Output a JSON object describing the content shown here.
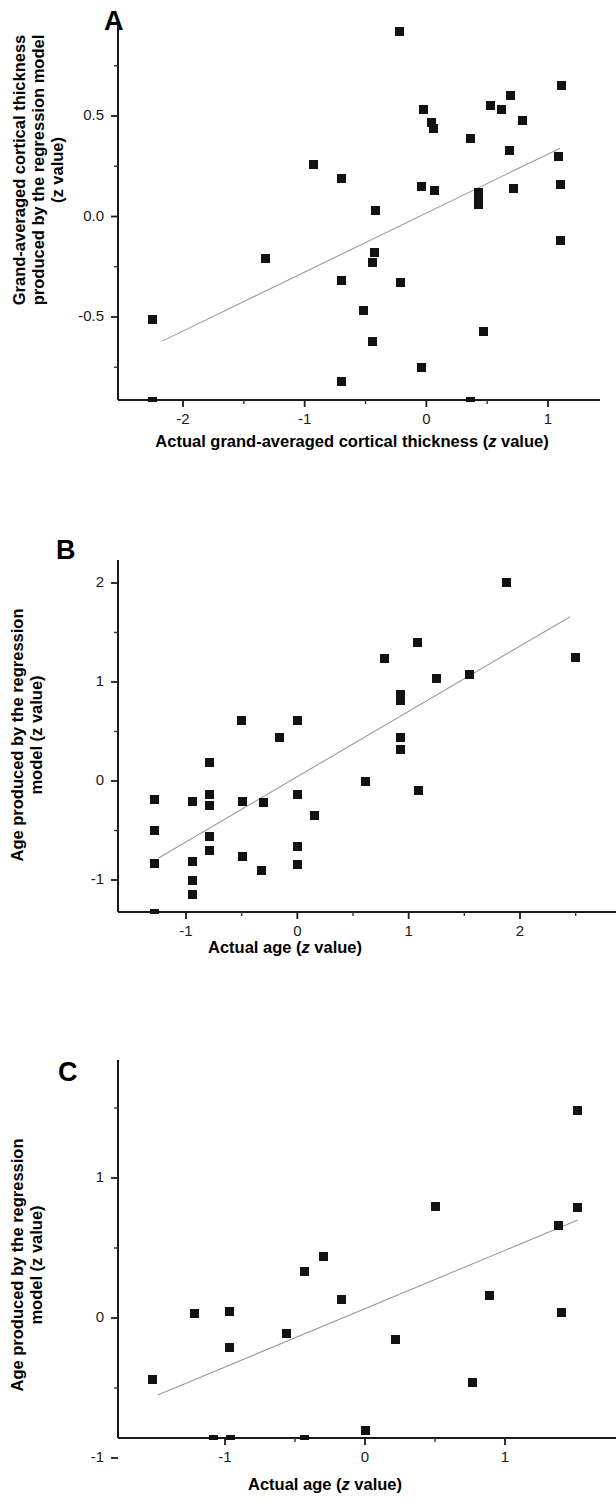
{
  "figure": {
    "panels": [
      "A",
      "B",
      "C"
    ]
  },
  "panel_a": {
    "letter": "A",
    "ylabel_lines": [
      "Grand-averaged cortical thickness",
      "produced by the regression model",
      "(z value)"
    ],
    "xlabel_prefix": "Actual grand-averaged cortical thickness (",
    "xlabel_italic": "z",
    "xlabel_suffix": " value)",
    "xticks": [
      "-2",
      "-1",
      "0",
      "1"
    ],
    "yticks": [
      "0.5",
      "0.0",
      "-0.5"
    ]
  },
  "panel_b": {
    "letter": "B",
    "ylabel_lines": [
      "Age produced by the regression",
      "model (z value)"
    ],
    "xlabel_prefix": "Actual age  (",
    "xlabel_italic": "z",
    "xlabel_suffix": " value)",
    "xticks": [
      "-1",
      "0",
      "1",
      "2"
    ],
    "yticks": [
      "2",
      "1",
      "0",
      "-1"
    ]
  },
  "panel_c": {
    "letter": "C",
    "ylabel_lines": [
      "Age produced by the regression",
      "model (z value)"
    ],
    "xlabel_prefix": "Actual age  (",
    "xlabel_italic": "z",
    "xlabel_suffix": " value)",
    "xticks": [
      "-1",
      "0",
      "1"
    ],
    "yticks": [
      "1",
      "0",
      "-1"
    ]
  },
  "chart_data": [
    {
      "type": "scatter",
      "panel": "A",
      "title": "A",
      "xlabel": "Actual grand-averaged cortical thickness (z value)",
      "ylabel": "Grand-averaged cortical thickness produced by the regression model (z value)",
      "xlim": [
        -2.45,
        1.32
      ],
      "ylim": [
        -0.93,
        0.93
      ],
      "xticks": [
        -2,
        -1,
        0,
        1
      ],
      "yticks": [
        0.5,
        0.0,
        -0.5
      ],
      "grid": false,
      "legend": null,
      "marker": "filled-square",
      "points": [
        {
          "x": -0.22,
          "y": 0.92
        },
        {
          "x": 1.11,
          "y": 0.65
        },
        {
          "x": 0.69,
          "y": 0.6
        },
        {
          "x": 0.53,
          "y": 0.55
        },
        {
          "x": 0.62,
          "y": 0.53
        },
        {
          "x": -0.02,
          "y": 0.53
        },
        {
          "x": 0.79,
          "y": 0.48
        },
        {
          "x": 0.04,
          "y": 0.47
        },
        {
          "x": 0.06,
          "y": 0.44
        },
        {
          "x": 0.36,
          "y": 0.39
        },
        {
          "x": 0.68,
          "y": 0.33
        },
        {
          "x": 1.09,
          "y": 0.3
        },
        {
          "x": -0.93,
          "y": 0.26
        },
        {
          "x": -0.7,
          "y": 0.19
        },
        {
          "x": 1.1,
          "y": 0.16
        },
        {
          "x": -0.04,
          "y": 0.15
        },
        {
          "x": 0.72,
          "y": 0.14
        },
        {
          "x": 0.07,
          "y": 0.13
        },
        {
          "x": 0.43,
          "y": 0.12
        },
        {
          "x": 0.43,
          "y": 0.08
        },
        {
          "x": 0.43,
          "y": 0.06
        },
        {
          "x": -0.42,
          "y": 0.03
        },
        {
          "x": 1.1,
          "y": -0.12
        },
        {
          "x": -0.43,
          "y": -0.18
        },
        {
          "x": -1.32,
          "y": -0.21
        },
        {
          "x": -0.44,
          "y": -0.23
        },
        {
          "x": -0.7,
          "y": -0.32
        },
        {
          "x": -0.21,
          "y": -0.33
        },
        {
          "x": -0.52,
          "y": -0.47
        },
        {
          "x": -2.25,
          "y": -0.51
        },
        {
          "x": 0.47,
          "y": -0.57
        },
        {
          "x": -0.44,
          "y": -0.62
        },
        {
          "x": -0.04,
          "y": -0.75
        },
        {
          "x": -0.7,
          "y": -0.82
        },
        {
          "x": -2.25,
          "y": -0.92
        },
        {
          "x": 0.36,
          "y": -0.92
        }
      ],
      "regression_line": {
        "x1": -2.17,
        "y1": -0.62,
        "x2": 1.1,
        "y2": 0.34
      }
    },
    {
      "type": "scatter",
      "panel": "B",
      "title": "B",
      "xlabel": "Actual age  (z value)",
      "ylabel": "Age produced by the regression model (z value)",
      "xlim": [
        -1.45,
        2.66
      ],
      "ylim": [
        -1.45,
        2.3
      ],
      "xticks": [
        -1,
        0,
        1,
        2
      ],
      "yticks": [
        2,
        1,
        0,
        -1
      ],
      "grid": false,
      "legend": null,
      "marker": "filled-square",
      "points": [
        {
          "x": 1.88,
          "y": 2.01
        },
        {
          "x": 1.08,
          "y": 1.4
        },
        {
          "x": 2.5,
          "y": 1.25
        },
        {
          "x": 0.78,
          "y": 1.24
        },
        {
          "x": 1.55,
          "y": 1.08
        },
        {
          "x": 1.25,
          "y": 1.04
        },
        {
          "x": 0.93,
          "y": 0.87
        },
        {
          "x": 0.93,
          "y": 0.81
        },
        {
          "x": -0.5,
          "y": 0.61
        },
        {
          "x": 0.0,
          "y": 0.61
        },
        {
          "x": -0.16,
          "y": 0.44
        },
        {
          "x": 0.93,
          "y": 0.44
        },
        {
          "x": 0.93,
          "y": 0.32
        },
        {
          "x": -0.79,
          "y": 0.19
        },
        {
          "x": 0.61,
          "y": 0.0
        },
        {
          "x": 1.09,
          "y": -0.1
        },
        {
          "x": -0.79,
          "y": -0.14
        },
        {
          "x": 0.0,
          "y": -0.14
        },
        {
          "x": -1.28,
          "y": -0.19
        },
        {
          "x": -0.94,
          "y": -0.21
        },
        {
          "x": -0.49,
          "y": -0.21
        },
        {
          "x": -0.3,
          "y": -0.22
        },
        {
          "x": -0.79,
          "y": -0.25
        },
        {
          "x": 0.15,
          "y": -0.35
        },
        {
          "x": -1.28,
          "y": -0.5
        },
        {
          "x": -0.79,
          "y": -0.56
        },
        {
          "x": 0.0,
          "y": -0.66
        },
        {
          "x": -0.79,
          "y": -0.7
        },
        {
          "x": -0.49,
          "y": -0.76
        },
        {
          "x": -0.94,
          "y": -0.81
        },
        {
          "x": -1.28,
          "y": -0.83
        },
        {
          "x": 0.0,
          "y": -0.84
        },
        {
          "x": -0.32,
          "y": -0.9
        },
        {
          "x": -0.94,
          "y": -1.01
        },
        {
          "x": -0.94,
          "y": -1.15
        },
        {
          "x": -1.28,
          "y": -1.43
        }
      ],
      "regression_line": {
        "x1": -1.25,
        "y1": -0.78,
        "x2": 2.45,
        "y2": 1.66
      }
    },
    {
      "type": "scatter",
      "panel": "C",
      "title": "C",
      "xlabel": "Actual age  (z value)",
      "ylabel": "Age produced by the regression model (z value)",
      "xlim": [
        -1.72,
        1.62
      ],
      "ylim": [
        -1.05,
        1.52
      ],
      "xticks": [
        -1,
        0,
        1
      ],
      "yticks": [
        1,
        0,
        -1
      ],
      "grid": false,
      "legend": null,
      "marker": "filled-square",
      "points": [
        {
          "x": 1.52,
          "y": 1.48
        },
        {
          "x": 0.5,
          "y": 0.8
        },
        {
          "x": 1.52,
          "y": 0.79
        },
        {
          "x": 1.38,
          "y": 0.66
        },
        {
          "x": -0.3,
          "y": 0.44
        },
        {
          "x": -0.43,
          "y": 0.33
        },
        {
          "x": -0.17,
          "y": 0.13
        },
        {
          "x": 0.89,
          "y": 0.16
        },
        {
          "x": -1.22,
          "y": 0.03
        },
        {
          "x": -0.97,
          "y": 0.05
        },
        {
          "x": 1.4,
          "y": 0.04
        },
        {
          "x": -0.56,
          "y": -0.11
        },
        {
          "x": 0.22,
          "y": -0.15
        },
        {
          "x": -0.97,
          "y": -0.21
        },
        {
          "x": -1.52,
          "y": -0.44
        },
        {
          "x": 0.77,
          "y": -0.46
        },
        {
          "x": 0.0,
          "y": -0.8
        },
        {
          "x": -1.08,
          "y": -0.89
        },
        {
          "x": -0.96,
          "y": -0.92
        },
        {
          "x": -0.43,
          "y": -1.0
        }
      ],
      "regression_line": {
        "x1": -1.48,
        "y1": -0.55,
        "x2": 1.52,
        "y2": 0.7
      }
    }
  ]
}
